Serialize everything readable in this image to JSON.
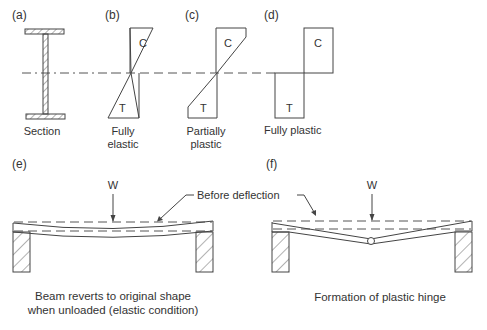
{
  "figure": {
    "panels": {
      "a": {
        "tag": "(a)",
        "caption": "Section"
      },
      "b": {
        "tag": "(b)",
        "caption_line1": "Fully",
        "caption_line2": "elastic",
        "compression": "C",
        "tension": "T"
      },
      "c": {
        "tag": "(c)",
        "caption_line1": "Partially",
        "caption_line2": "plastic",
        "compression": "C",
        "tension": "T"
      },
      "d": {
        "tag": "(d)",
        "caption": "Fully plastic",
        "compression": "C",
        "tension": "T"
      },
      "e": {
        "tag": "(e)",
        "load": "W",
        "caption_line1": "Beam reverts to original shape",
        "caption_line2": "when unloaded (elastic condition)"
      },
      "f": {
        "tag": "(f)",
        "load": "W",
        "caption": "Formation of plastic hinge"
      }
    },
    "shared_annotation": "Before deflection"
  }
}
